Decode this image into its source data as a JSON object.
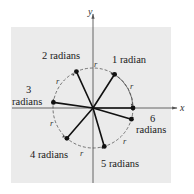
{
  "diagram": {
    "axes": {
      "x_label": "x",
      "y_label": "y"
    },
    "arc_label": "r",
    "colors": {
      "background": "#ffffff",
      "panel": "#ebebeb",
      "axis": "#555555",
      "segment": "#111111",
      "circle": "#555555"
    },
    "points": [
      {
        "id": "1",
        "angle": 1,
        "label_line1": "1 radian",
        "label_line2": ""
      },
      {
        "id": "2",
        "angle": 2,
        "label_line1": "2 radians",
        "label_line2": ""
      },
      {
        "id": "3",
        "angle": 3,
        "label_line1": "3",
        "label_line2": "radians"
      },
      {
        "id": "4",
        "angle": 4,
        "label_line1": "4 radians",
        "label_line2": ""
      },
      {
        "id": "5",
        "angle": 5,
        "label_line1": "5 radians",
        "label_line2": ""
      },
      {
        "id": "6",
        "angle": 6,
        "label_line1": "6",
        "label_line2": "radians"
      }
    ]
  }
}
